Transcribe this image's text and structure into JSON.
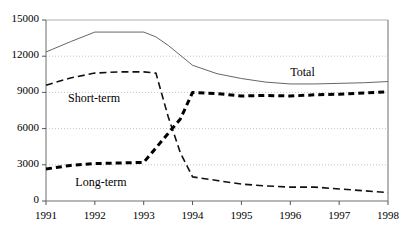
{
  "chart_data": {
    "type": "line",
    "title": "",
    "xlabel": "",
    "ylabel": "",
    "xlim": [
      1991,
      1998
    ],
    "ylim": [
      0,
      15000
    ],
    "grid": "horizontal-dotted",
    "legend_position": "inline-annotations",
    "y_ticks": [
      "0",
      "3000",
      "6000",
      "9000",
      "12000",
      "15000"
    ],
    "y_tick_values": [
      0,
      3000,
      6000,
      9000,
      12000,
      15000
    ],
    "x_ticks": [
      "1991",
      "1992",
      "1993",
      "1994",
      "1995",
      "1996",
      "1997",
      "1998"
    ],
    "x_tick_values": [
      1991,
      1992,
      1993,
      1994,
      1995,
      1996,
      1997,
      1998
    ],
    "annotations": [
      {
        "text": "Total",
        "x": 1996.0,
        "y": 10600,
        "name": "total"
      },
      {
        "text": "Short-term",
        "x": 1991.45,
        "y": 8450,
        "name": "short-term"
      },
      {
        "text": "Long-term",
        "x": 1991.6,
        "y": 1500,
        "name": "long-term"
      }
    ],
    "series": [
      {
        "name": "Total",
        "style": "solid-thin",
        "color": "#555555",
        "x": [
          1991.0,
          1991.5,
          1992.0,
          1992.5,
          1993.0,
          1993.25,
          1993.5,
          1994.0,
          1994.5,
          1995.0,
          1995.5,
          1996.0,
          1996.5,
          1997.0,
          1997.5,
          1998.0
        ],
        "values": [
          12350,
          13200,
          14000,
          14000,
          14000,
          13600,
          12900,
          11250,
          10550,
          10150,
          9850,
          9700,
          9700,
          9750,
          9800,
          9900
        ]
      },
      {
        "name": "Short-term",
        "style": "dashed",
        "color": "#111111",
        "x": [
          1991.0,
          1991.5,
          1992.0,
          1992.5,
          1993.0,
          1993.25,
          1993.5,
          1993.75,
          1994.0,
          1994.5,
          1995.0,
          1995.5,
          1996.0,
          1996.5,
          1997.0,
          1997.5,
          1998.0
        ],
        "values": [
          9600,
          10200,
          10600,
          10700,
          10700,
          10600,
          7000,
          4000,
          2000,
          1700,
          1400,
          1250,
          1150,
          1150,
          1000,
          850,
          700
        ]
      },
      {
        "name": "Long-term",
        "style": "thick-dotted",
        "color": "#000000",
        "x": [
          1991.0,
          1991.5,
          1992.0,
          1992.5,
          1993.0,
          1993.25,
          1993.5,
          1993.75,
          1994.0,
          1994.5,
          1995.0,
          1995.5,
          1996.0,
          1996.5,
          1997.0,
          1997.5,
          1998.0
        ],
        "values": [
          2650,
          2950,
          3100,
          3150,
          3200,
          4400,
          5600,
          6800,
          9000,
          8900,
          8700,
          8750,
          8700,
          8800,
          8850,
          8950,
          9050
        ]
      }
    ]
  }
}
